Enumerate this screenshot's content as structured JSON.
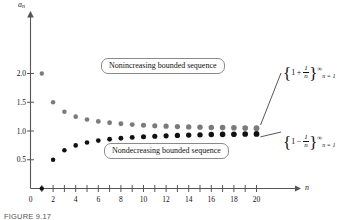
{
  "figure": {
    "caption": "FIGURE 9.17",
    "axis_x_label": "n",
    "axis_y_label": "a",
    "axis_y_label_sub": "n"
  },
  "callouts": {
    "upper": "Nonincreasing bounded sequence",
    "lower": "Nondecreasing bounded sequence"
  },
  "annotations": {
    "upper": {
      "open": "{",
      "one": "1",
      "op": "+",
      "num": "1",
      "den": "n",
      "close": "}",
      "sup": "∞",
      "sub": "n = 1"
    },
    "lower": {
      "open": "{",
      "one": "1",
      "op": "−",
      "num": "1",
      "den": "n",
      "close": "}",
      "sup": "∞",
      "sub": "n = 1"
    }
  },
  "chart_data": {
    "type": "scatter",
    "title": "",
    "xlabel": "n",
    "ylabel": "a_n",
    "xlim": [
      0,
      21
    ],
    "ylim": [
      0,
      2.15
    ],
    "grid": false,
    "legend_position": "right-annotations",
    "xticks": [
      1,
      2,
      3,
      4,
      5,
      6,
      7,
      8,
      9,
      10,
      11,
      12,
      13,
      14,
      15,
      16,
      17,
      18,
      19,
      20
    ],
    "xtick_labels": [
      {
        "x": 0,
        "label": "0"
      },
      {
        "x": 2,
        "label": "2"
      },
      {
        "x": 4,
        "label": "4"
      },
      {
        "x": 6,
        "label": "6"
      },
      {
        "x": 8,
        "label": "8"
      },
      {
        "x": 10,
        "label": "10"
      },
      {
        "x": 12,
        "label": "12"
      },
      {
        "x": 14,
        "label": "14"
      },
      {
        "x": 16,
        "label": "16"
      },
      {
        "x": 18,
        "label": "18"
      },
      {
        "x": 20,
        "label": "20"
      }
    ],
    "yticks": [
      0.5,
      1.0,
      1.5,
      2.0
    ],
    "ytick_labels": [
      "0.5",
      "1.0",
      "1.5",
      "2.0"
    ],
    "series": [
      {
        "name": "{1 + 1/n}",
        "color": "#7a7a7a",
        "marker": "circle",
        "x": [
          1,
          2,
          3,
          4,
          5,
          6,
          7,
          8,
          9,
          10,
          11,
          12,
          13,
          14,
          15,
          16,
          17,
          18,
          19,
          20
        ],
        "values": [
          2.0,
          1.5,
          1.3333,
          1.25,
          1.2,
          1.1667,
          1.1429,
          1.125,
          1.1111,
          1.1,
          1.0909,
          1.0833,
          1.0769,
          1.0714,
          1.0667,
          1.0625,
          1.0588,
          1.0556,
          1.0526,
          1.05
        ]
      },
      {
        "name": "{1 - 1/n}",
        "color": "#111111",
        "marker": "circle",
        "x": [
          1,
          2,
          3,
          4,
          5,
          6,
          7,
          8,
          9,
          10,
          11,
          12,
          13,
          14,
          15,
          16,
          17,
          18,
          19,
          20
        ],
        "values": [
          0.0,
          0.5,
          0.6667,
          0.75,
          0.8,
          0.8333,
          0.8571,
          0.875,
          0.8889,
          0.9,
          0.9091,
          0.9167,
          0.9231,
          0.9286,
          0.9333,
          0.9375,
          0.9412,
          0.9444,
          0.9474,
          0.95
        ]
      }
    ]
  }
}
